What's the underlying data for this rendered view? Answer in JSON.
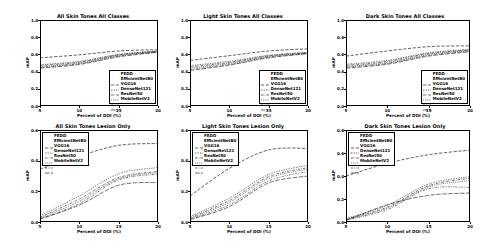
{
  "figure": {
    "background": "#ffffff",
    "line_color": "#000000",
    "rows": 2,
    "cols": 3
  },
  "series_names": [
    "FEDD",
    "EfficientNetB0",
    "VGG16",
    "DenseNet121",
    "ResNet50",
    "MobileNetV2"
  ],
  "axis": {
    "xlabel": "Percent of DOI (%)",
    "ylabel": "mAP",
    "xticks": [
      "5",
      "10",
      "15",
      "20"
    ],
    "yticks_full": [
      "0.0",
      "0.2",
      "0.4",
      "0.6",
      "0.8",
      "1.0"
    ],
    "yticks_06": [
      "0.0",
      "0.2",
      "0.4",
      "0.6"
    ],
    "yticks_08": [
      "0.0",
      "0.2",
      "0.4",
      "0.6",
      "0.8"
    ]
  },
  "chart_data": [
    {
      "id": "all-skin-all-classes",
      "type": "line",
      "title": "All Skin Tones All Classes",
      "xlabel": "Percent of DOI (%)",
      "ylabel": "mAP",
      "x": [
        5,
        10,
        15,
        20
      ],
      "xlim": [
        5,
        20
      ],
      "ylim": [
        0.0,
        1.0
      ],
      "grid": false,
      "legend_position": "lower right",
      "series": [
        {
          "name": "FEDD",
          "values": [
            0.56,
            0.595,
            0.64,
            0.655
          ]
        },
        {
          "name": "EfficientNetB0",
          "values": [
            0.48,
            0.52,
            0.6,
            0.64
          ]
        },
        {
          "name": "VGG16",
          "values": [
            0.47,
            0.51,
            0.595,
            0.637
          ]
        },
        {
          "name": "DenseNet121",
          "values": [
            0.458,
            0.5,
            0.588,
            0.632
          ]
        },
        {
          "name": "ResNet50",
          "values": [
            0.448,
            0.492,
            0.58,
            0.628
          ]
        },
        {
          "name": "MobileNetV2",
          "values": [
            0.44,
            0.483,
            0.572,
            0.625
          ]
        }
      ]
    },
    {
      "id": "light-skin-all-classes",
      "type": "line",
      "title": "Light Skin Tones All Classes",
      "xlabel": "Percent of DOI (%)",
      "ylabel": "mAP",
      "x": [
        5,
        10,
        15,
        20
      ],
      "xlim": [
        5,
        20
      ],
      "ylim": [
        0.0,
        1.0
      ],
      "grid": false,
      "legend_position": "lower right",
      "series": [
        {
          "name": "FEDD",
          "values": [
            0.53,
            0.585,
            0.64,
            0.665
          ]
        },
        {
          "name": "EfficientNetB0",
          "values": [
            0.47,
            0.52,
            0.59,
            0.625
          ]
        },
        {
          "name": "VGG16",
          "values": [
            0.455,
            0.508,
            0.583,
            0.62
          ]
        },
        {
          "name": "DenseNet121",
          "values": [
            0.44,
            0.497,
            0.576,
            0.616
          ]
        },
        {
          "name": "ResNet50",
          "values": [
            0.425,
            0.486,
            0.568,
            0.612
          ]
        },
        {
          "name": "MobileNetV2",
          "values": [
            0.412,
            0.476,
            0.56,
            0.608
          ]
        }
      ]
    },
    {
      "id": "dark-skin-all-classes",
      "type": "line",
      "title": "Dark Skin Tones All Classes",
      "xlabel": "Percent of DOI (%)",
      "ylabel": "mAP",
      "x": [
        5,
        10,
        15,
        20
      ],
      "xlim": [
        5,
        20
      ],
      "ylim": [
        0.0,
        1.0
      ],
      "grid": false,
      "legend_position": "lower right",
      "series": [
        {
          "name": "FEDD",
          "values": [
            0.58,
            0.64,
            0.69,
            0.7
          ]
        },
        {
          "name": "EfficientNetB0",
          "values": [
            0.485,
            0.53,
            0.62,
            0.66
          ]
        },
        {
          "name": "VGG16",
          "values": [
            0.472,
            0.518,
            0.61,
            0.652
          ]
        },
        {
          "name": "DenseNet121",
          "values": [
            0.46,
            0.506,
            0.6,
            0.645
          ]
        },
        {
          "name": "ResNet50",
          "values": [
            0.45,
            0.496,
            0.59,
            0.638
          ]
        },
        {
          "name": "MobileNetV2",
          "values": [
            0.44,
            0.486,
            0.58,
            0.63
          ]
        }
      ]
    },
    {
      "id": "all-skin-lesion-only",
      "type": "line",
      "title": "All Skin Tones Lesion Only",
      "xlabel": "Percent of DOI (%)",
      "ylabel": "mAP",
      "x": [
        5,
        10,
        15,
        20
      ],
      "xlim": [
        5,
        20
      ],
      "ylim": [
        0.0,
        0.6
      ],
      "grid": false,
      "legend_position": "upper left",
      "series": [
        {
          "name": "FEDD",
          "values": [
            0.345,
            0.43,
            0.5,
            0.512
          ]
        },
        {
          "name": "EfficientNetB0",
          "values": [
            0.04,
            0.17,
            0.315,
            0.355
          ]
        },
        {
          "name": "VGG16",
          "values": [
            0.03,
            0.15,
            0.29,
            0.33
          ]
        },
        {
          "name": "DenseNet121",
          "values": [
            0.025,
            0.135,
            0.282,
            0.322
          ]
        },
        {
          "name": "ResNet50",
          "values": [
            0.02,
            0.12,
            0.275,
            0.312
          ]
        },
        {
          "name": "MobileNetV2",
          "values": [
            0.018,
            0.11,
            0.24,
            0.258
          ]
        }
      ]
    },
    {
      "id": "light-skin-lesion-only",
      "type": "line",
      "title": "Light Skin Tones Lesion Only",
      "xlabel": "Percent of DOI (%)",
      "ylabel": "mAP",
      "x": [
        5,
        10,
        15,
        20
      ],
      "xlim": [
        5,
        20
      ],
      "ylim": [
        0.0,
        0.6
      ],
      "grid": false,
      "legend_position": "upper left",
      "series": [
        {
          "name": "FEDD",
          "values": [
            0.17,
            0.35,
            0.47,
            0.48
          ]
        },
        {
          "name": "EfficientNetB0",
          "values": [
            0.035,
            0.155,
            0.31,
            0.37
          ]
        },
        {
          "name": "VGG16",
          "values": [
            0.028,
            0.14,
            0.295,
            0.355
          ]
        },
        {
          "name": "DenseNet121",
          "values": [
            0.022,
            0.128,
            0.285,
            0.345
          ]
        },
        {
          "name": "ResNet50",
          "values": [
            0.018,
            0.112,
            0.268,
            0.33
          ]
        },
        {
          "name": "MobileNetV2",
          "values": [
            0.015,
            0.1,
            0.255,
            0.3
          ]
        }
      ]
    },
    {
      "id": "dark-skin-lesion-only",
      "type": "line",
      "title": "Dark Skin Tones Lesion Only",
      "xlabel": "Percent of DOI (%)",
      "ylabel": "mAP",
      "x": [
        5,
        10,
        15,
        20
      ],
      "xlim": [
        5,
        20
      ],
      "ylim": [
        0.0,
        0.8
      ],
      "grid": false,
      "legend_position": "upper left",
      "series": [
        {
          "name": "FEDD",
          "values": [
            0.4,
            0.51,
            0.585,
            0.625
          ]
        },
        {
          "name": "EfficientNetB0",
          "values": [
            0.03,
            0.145,
            0.33,
            0.395
          ]
        },
        {
          "name": "VGG16",
          "values": [
            0.025,
            0.13,
            0.315,
            0.382
          ]
        },
        {
          "name": "DenseNet121",
          "values": [
            0.02,
            0.12,
            0.305,
            0.36
          ]
        },
        {
          "name": "ResNet50",
          "values": [
            0.016,
            0.108,
            0.29,
            0.3
          ]
        },
        {
          "name": "MobileNetV2",
          "values": [
            0.014,
            0.15,
            0.232,
            0.252
          ]
        }
      ]
    }
  ]
}
